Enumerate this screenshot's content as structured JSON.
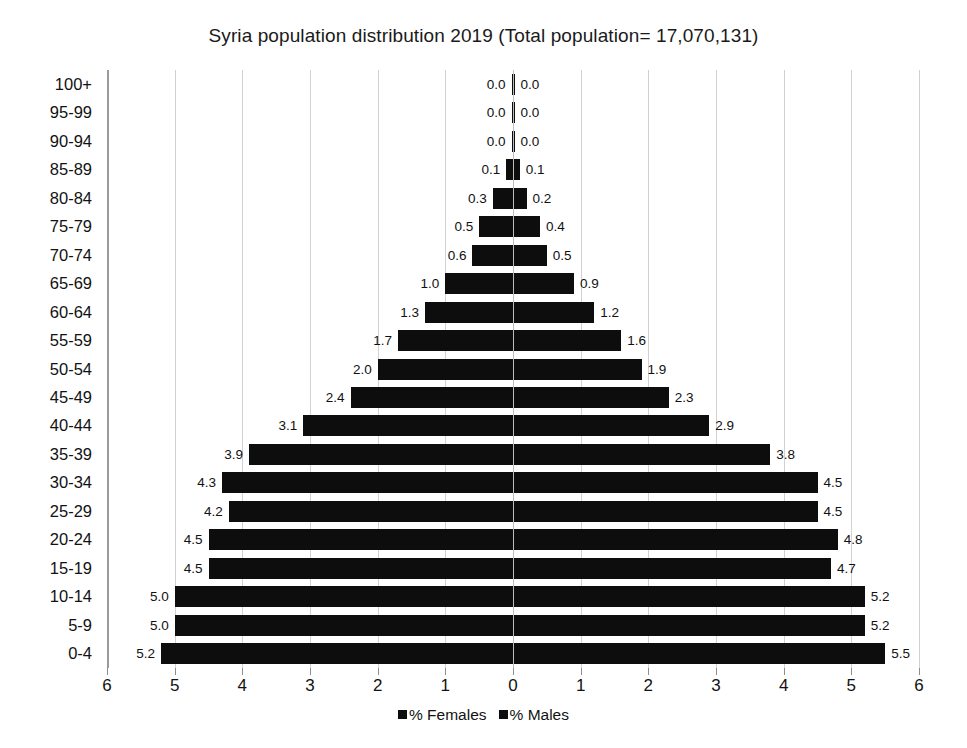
{
  "chart_data": {
    "type": "bar",
    "subtype": "population-pyramid",
    "title": "Syria population distribution 2019 (Total population= 17,070,131)",
    "xlabel": "",
    "ylabel": "",
    "xlim": [
      -6,
      6
    ],
    "xticks": [
      "6",
      "5",
      "4",
      "3",
      "2",
      "1",
      "0",
      "1",
      "2",
      "3",
      "4",
      "5",
      "6"
    ],
    "xtick_values": [
      -6,
      -5,
      -4,
      -3,
      -2,
      -1,
      0,
      1,
      2,
      3,
      4,
      5,
      6
    ],
    "grid": true,
    "legend_position": "bottom",
    "categories": [
      "100+",
      "95-99",
      "90-94",
      "85-89",
      "80-84",
      "75-79",
      "70-74",
      "65-69",
      "60-64",
      "55-59",
      "50-54",
      "45-49",
      "40-44",
      "35-39",
      "30-34",
      "25-29",
      "20-24",
      "15-19",
      "10-14",
      "5-9",
      "0-4"
    ],
    "series": [
      {
        "name": "% Females",
        "direction": "left",
        "color": "#0d0d0d",
        "values": [
          0.0,
          0.0,
          0.0,
          0.1,
          0.3,
          0.5,
          0.6,
          1.0,
          1.3,
          1.7,
          2.0,
          2.4,
          3.1,
          3.9,
          4.3,
          4.2,
          4.5,
          4.5,
          5.0,
          5.0,
          5.2
        ],
        "labels": [
          "0.0",
          "0.0",
          "0.0",
          "0.1",
          "0.3",
          "0.5",
          "0.6",
          "1.0",
          "1.3",
          "1.7",
          "2.0",
          "2.4",
          "3.1",
          "3.9",
          "4.3",
          "4.2",
          "4.5",
          "4.5",
          "5.0",
          "5.0",
          "5.2"
        ]
      },
      {
        "name": "% Males",
        "direction": "right",
        "color": "#0d0d0d",
        "values": [
          0.0,
          0.0,
          0.0,
          0.1,
          0.2,
          0.4,
          0.5,
          0.9,
          1.2,
          1.6,
          1.9,
          2.3,
          2.9,
          3.8,
          4.5,
          4.5,
          4.8,
          4.7,
          5.2,
          5.2,
          5.5
        ],
        "labels": [
          "0.0",
          "0.0",
          "0.0",
          "0.1",
          "0.2",
          "0.4",
          "0.5",
          "0.9",
          "1.2",
          "1.6",
          "1.9",
          "2.3",
          "2.9",
          "3.8",
          "4.5",
          "4.5",
          "4.8",
          "4.7",
          "5.2",
          "5.2",
          "5.5"
        ]
      }
    ]
  },
  "legend": {
    "items": [
      {
        "label": "% Females"
      },
      {
        "label": "% Males"
      }
    ]
  }
}
